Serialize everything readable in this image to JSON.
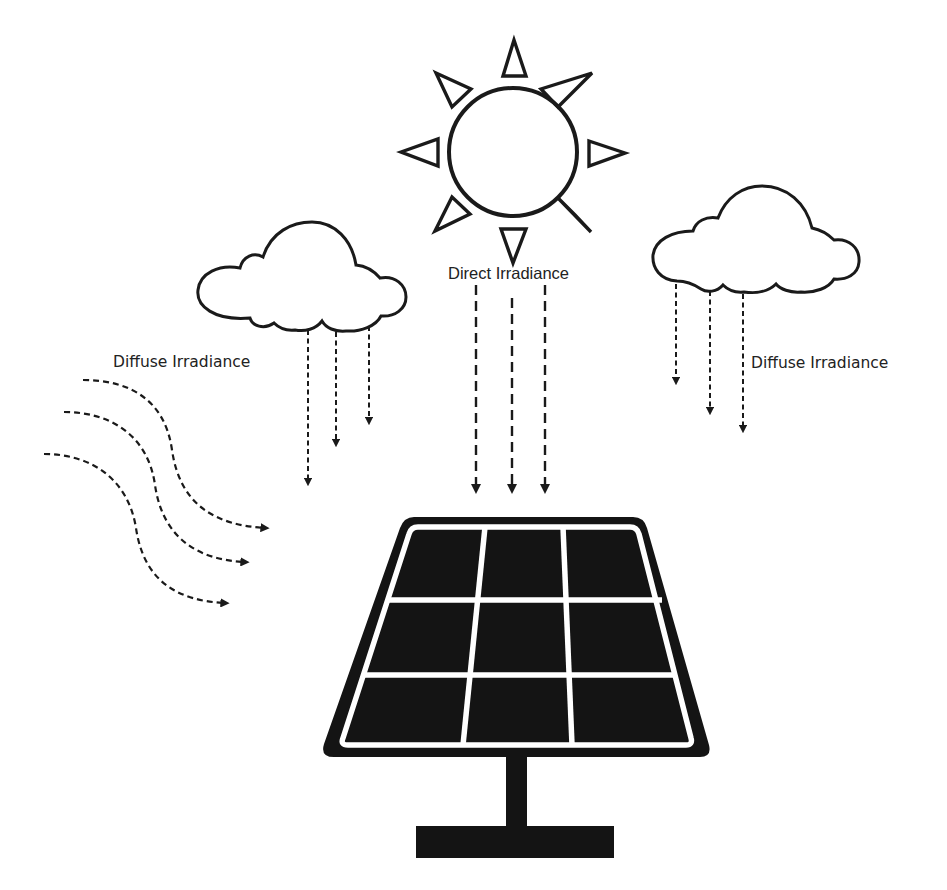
{
  "diagram": {
    "colors": {
      "background": "#ffffff",
      "stroke": "#1a1a1a",
      "panel": "#141414",
      "text": "#222222"
    },
    "labels": {
      "direct": "Direct Irradiance",
      "diffuse_left": "Diffuse Irradiance",
      "diffuse_right": "Diffuse Irradiance"
    },
    "elements": [
      {
        "id": "sun",
        "icon": "sun-icon",
        "rays": 8
      },
      {
        "id": "cloud-left",
        "icon": "cloud-icon",
        "arrows": 3
      },
      {
        "id": "cloud-right",
        "icon": "cloud-icon",
        "arrows": 3
      },
      {
        "id": "direct-arrows",
        "count": 3,
        "style": "long-dash"
      },
      {
        "id": "scattered-arrows",
        "count": 3,
        "style": "curved-dotted"
      },
      {
        "id": "solar-panel",
        "icon": "solar-panel-icon",
        "grid": "3x3"
      }
    ]
  }
}
